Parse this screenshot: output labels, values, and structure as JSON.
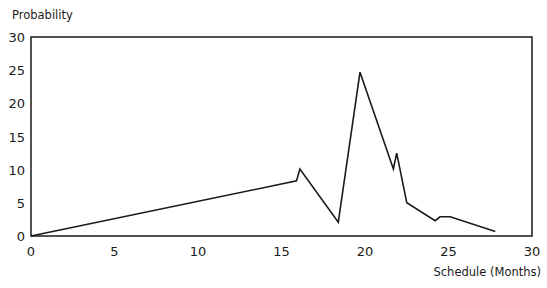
{
  "chart_data": {
    "type": "line",
    "title": "",
    "xlabel": "Schedule (Months)",
    "ylabel": "Probability",
    "xlim": [
      0,
      30
    ],
    "ylim": [
      0,
      30
    ],
    "x_ticks": [
      0,
      5,
      10,
      15,
      20,
      25,
      30
    ],
    "y_ticks": [
      0,
      5,
      10,
      15,
      20,
      25,
      30
    ],
    "grid": false,
    "legend": null,
    "frame": "box",
    "series": [
      {
        "name": "Probability",
        "color": "#1a1a1a",
        "points": [
          {
            "x": 0.0,
            "y": 0.0
          },
          {
            "x": 15.9,
            "y": 8.3
          },
          {
            "x": 16.1,
            "y": 10.1
          },
          {
            "x": 18.4,
            "y": 2.1
          },
          {
            "x": 19.7,
            "y": 24.7
          },
          {
            "x": 21.7,
            "y": 10.1
          },
          {
            "x": 21.9,
            "y": 12.5
          },
          {
            "x": 22.5,
            "y": 5.0
          },
          {
            "x": 24.2,
            "y": 2.3
          },
          {
            "x": 24.5,
            "y": 2.9
          },
          {
            "x": 25.1,
            "y": 2.9
          },
          {
            "x": 27.8,
            "y": 0.7
          }
        ]
      }
    ]
  },
  "layout": {
    "plot_left": 31,
    "plot_top": 37,
    "plot_right": 532,
    "plot_bottom": 236
  }
}
